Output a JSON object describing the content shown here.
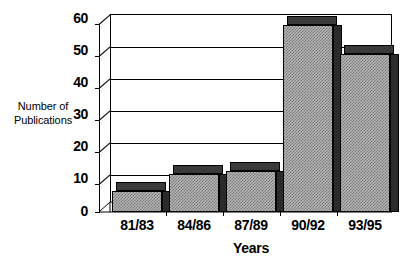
{
  "chart_data": {
    "type": "bar",
    "title": "",
    "subtitle": "",
    "xlabel": "Years",
    "ylabel": "Number of Publications",
    "ylabel_lines": [
      "Number of",
      "Publications"
    ],
    "categories": [
      "81/83",
      "84/86",
      "87/89",
      "90/92",
      "93/95"
    ],
    "values": [
      6.5,
      12,
      13,
      59,
      50
    ],
    "series": [
      {
        "name": "Number of Publications",
        "values": [
          6.5,
          12,
          13,
          59,
          50
        ]
      }
    ],
    "ylim": [
      0,
      60
    ],
    "yticks": [
      0,
      10,
      20,
      30,
      40,
      50,
      60
    ],
    "ytick_labels": [
      "0",
      "10",
      "20",
      "30",
      "40",
      "50",
      "60"
    ],
    "grid": true,
    "grid_axis": "y",
    "legend": false,
    "legend_position": "none",
    "style": "3d-bar",
    "bar_fill_color": "#b4b4b4",
    "bar_side_color": "#2b2b2b",
    "bar_edge_color": "#000000",
    "background_color": "#ffffff",
    "axis_color": "#000000"
  },
  "axes": {
    "y_title_line1": "Number of",
    "y_title_line2": "Publications",
    "x_title": "Years"
  }
}
